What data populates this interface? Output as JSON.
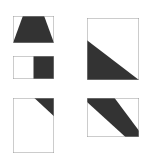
{
  "figure": {
    "background_color": "#ffffff",
    "fill_color": "#333333",
    "border_color": "#999999",
    "border_width_px": 1,
    "canvas_width_px": 148,
    "canvas_height_px": 160
  },
  "shapes": [
    {
      "id": "shape-1",
      "name": "trapezoid-bottom-fill",
      "description": "Landscape rectangle with dark trapezoid filling the lower portion, slanted left and right edges, flat top",
      "x": 13,
      "y": 16,
      "width": 41,
      "height": 27,
      "fill": "#333333",
      "stroke": "#999999",
      "polygon_percent": "0,100 24,0 76,0 100,100"
    },
    {
      "id": "shape-2",
      "name": "right-half-fill",
      "description": "Landscape rectangle split vertically; left half white, right half dark",
      "x": 13,
      "y": 56,
      "width": 41,
      "height": 23,
      "fill": "#333333",
      "stroke": "#999999",
      "polygon_percent": "50,0 100,0 100,100 50,100"
    },
    {
      "id": "shape-3",
      "name": "top-right-corner-triangle",
      "description": "Portrait rectangle with dark right triangle in the top-right corner",
      "x": 13,
      "y": 98,
      "width": 41,
      "height": 55,
      "fill": "#333333",
      "stroke": "#999999",
      "polygon_percent": "52,0 100,0 100,33"
    },
    {
      "id": "shape-4",
      "name": "bottom-left-corner-triangle",
      "description": "Square with dark right triangle occupying the bottom-left region",
      "x": 87,
      "y": 18,
      "width": 52,
      "height": 62,
      "fill": "#333333",
      "stroke": "#999999",
      "polygon_percent": "0,36 0,100 100,100"
    },
    {
      "id": "shape-5",
      "name": "diagonal-band",
      "description": "Landscape rectangle crossed by a dark diagonal band running from upper-left to lower-right",
      "x": 87,
      "y": 98,
      "width": 52,
      "height": 39,
      "fill": "#333333",
      "stroke": "#999999",
      "polygon_percent": "26,0 53,0 100,84 100,100 74,100 0,10 0,0"
    }
  ]
}
